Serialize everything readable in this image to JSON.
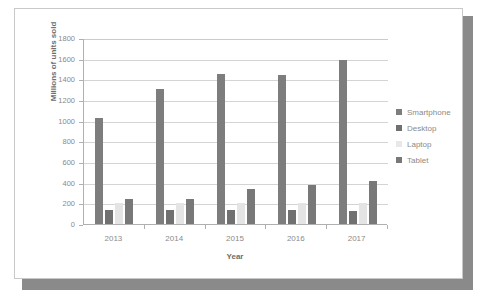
{
  "chart_data": {
    "type": "bar",
    "title": "",
    "xlabel": "Year",
    "ylabel": "Millions of units sold",
    "categories": [
      "2013",
      "2014",
      "2015",
      "2016",
      "2017"
    ],
    "ylim": [
      0,
      1800
    ],
    "ytick_step": 200,
    "yticks": [
      "0",
      "200",
      "400",
      "600",
      "800",
      "1000",
      "1200",
      "1400",
      "1600",
      "1800"
    ],
    "grid": true,
    "legend_position": "right",
    "series": [
      {
        "name": "Smartphone",
        "color": "#7d7d7d",
        "values": [
          1030,
          1310,
          1450,
          1440,
          1585
        ]
      },
      {
        "name": "Desktop",
        "color": "#707070",
        "values": [
          140,
          140,
          140,
          140,
          130
        ]
      },
      {
        "name": "Laptop",
        "color": "#e4e4e4",
        "values": [
          200,
          200,
          205,
          205,
          200
        ]
      },
      {
        "name": "Tablet",
        "color": "#787878",
        "values": [
          240,
          245,
          340,
          380,
          420
        ]
      }
    ]
  },
  "legend": {
    "items": [
      {
        "label": "Smartphone",
        "color": "#7d7d7d"
      },
      {
        "label": "Desktop",
        "color": "#707070"
      },
      {
        "label": "Laptop",
        "color": "#e8e8e8"
      },
      {
        "label": "Tablet",
        "color": "#787878"
      }
    ]
  },
  "frame": {
    "border_color": "#c9c9c9",
    "shadow_color": "#8a8a8a",
    "background": "#ffffff"
  }
}
